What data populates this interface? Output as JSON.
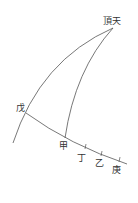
{
  "diagram": {
    "colors": {
      "line": "#555555",
      "text": "#333333",
      "background": "#ffffff"
    },
    "labels": {
      "zenith": "頂天",
      "wu": "戊",
      "jia": "甲",
      "ding": "丁",
      "yi": "乙",
      "geng": "庚"
    }
  }
}
